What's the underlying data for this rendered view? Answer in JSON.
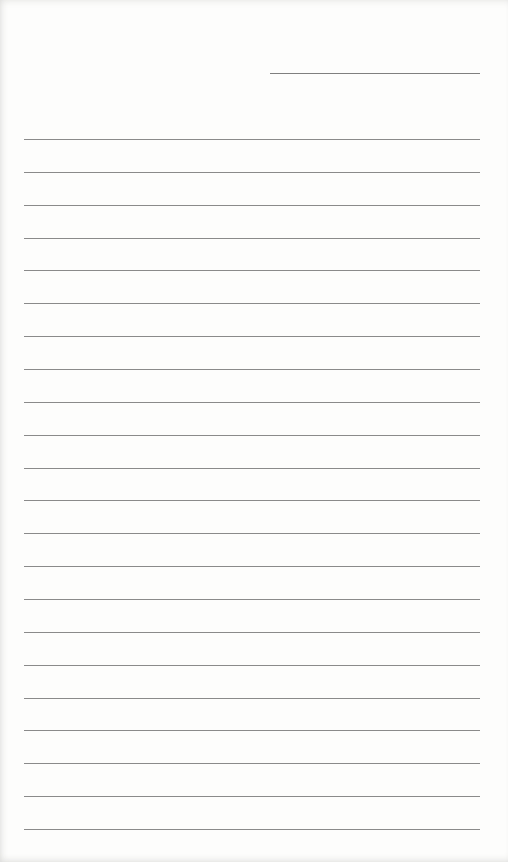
{
  "page": {
    "type": "lined-notepaper",
    "background_color": "#fdfdfc",
    "line_color": "#8a8a8a",
    "date_line": {
      "present": true,
      "text": ""
    },
    "ruled_lines": {
      "count": 22,
      "first_y": 139,
      "spacing_px": 32.86,
      "contents": [
        "",
        "",
        "",
        "",
        "",
        "",
        "",
        "",
        "",
        "",
        "",
        "",
        "",
        "",
        "",
        "",
        "",
        "",
        "",
        "",
        "",
        ""
      ]
    }
  }
}
